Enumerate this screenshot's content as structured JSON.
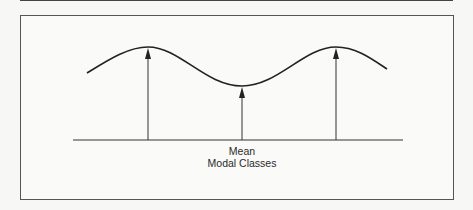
{
  "diagram": {
    "type": "bimodal-distribution",
    "labels": {
      "mean": "Mean",
      "modal_classes": "Modal Classes"
    },
    "curve": {
      "points": [
        [
          87,
          73
        ],
        [
          148,
          47
        ],
        [
          242,
          86
        ],
        [
          336,
          47
        ],
        [
          387,
          69
        ]
      ],
      "color": "#222222"
    },
    "arrows": [
      {
        "name": "left-mode-arrow",
        "x": 148,
        "y_top": 48,
        "y_bottom": 140
      },
      {
        "name": "mean-arrow",
        "x": 242,
        "y_top": 87,
        "y_bottom": 140
      },
      {
        "name": "right-mode-arrow",
        "x": 336,
        "y_top": 48,
        "y_bottom": 140
      }
    ],
    "baseline": {
      "x1": 73,
      "x2": 403,
      "y": 140
    }
  }
}
